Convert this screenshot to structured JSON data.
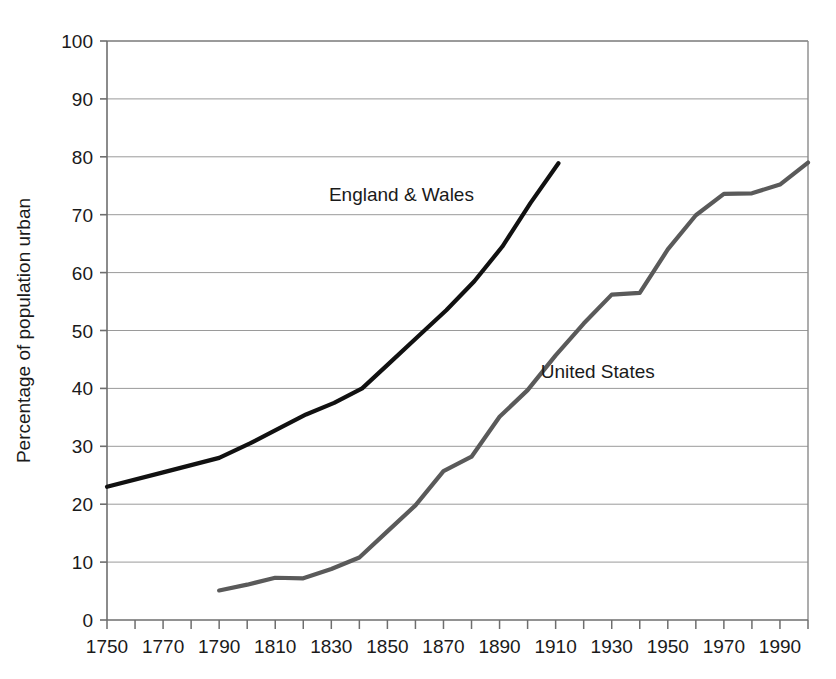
{
  "chart_data": {
    "type": "line",
    "title": "",
    "xlabel": "",
    "ylabel": "Percentage of population urban",
    "xlim": [
      1750,
      2000
    ],
    "ylim": [
      0,
      100
    ],
    "grid": true,
    "grid_axis": "y",
    "legend": "inline-annotations",
    "x_major_step": 20,
    "x_minor_step": 10,
    "y_step": 10,
    "xticks": [
      "1750",
      "1770",
      "1790",
      "1810",
      "1830",
      "1850",
      "1870",
      "1890",
      "1910",
      "1930",
      "1950",
      "1970",
      "1990"
    ],
    "xtick_values": [
      1750,
      1770,
      1790,
      1810,
      1830,
      1850,
      1870,
      1890,
      1910,
      1930,
      1950,
      1970,
      1990
    ],
    "yticks": [
      "0",
      "10",
      "20",
      "30",
      "40",
      "50",
      "60",
      "70",
      "80",
      "90",
      "100"
    ],
    "ytick_values": [
      0,
      10,
      20,
      30,
      40,
      50,
      60,
      70,
      80,
      90,
      100
    ],
    "series": [
      {
        "name": "England & Wales",
        "color": "#111111",
        "width": 4.2,
        "label_x": 1855,
        "label_y": 73.5,
        "label_anchor": "middle",
        "x": [
          1750,
          1770,
          1790,
          1801,
          1811,
          1821,
          1831,
          1841,
          1851,
          1861,
          1871,
          1881,
          1891,
          1901,
          1911
        ],
        "y": [
          23.0,
          25.5,
          28.0,
          30.5,
          33.0,
          35.5,
          37.5,
          40.0,
          44.5,
          49.0,
          53.5,
          58.5,
          64.5,
          72.0,
          78.9
        ]
      },
      {
        "name": "United States",
        "color": "#5a5a5a",
        "width": 4.2,
        "label_x": 1925,
        "label_y": 43.0,
        "label_anchor": "middle",
        "x": [
          1790,
          1800,
          1810,
          1820,
          1830,
          1840,
          1850,
          1860,
          1870,
          1880,
          1890,
          1900,
          1910,
          1920,
          1930,
          1940,
          1950,
          1960,
          1970,
          1980,
          1990,
          2000
        ],
        "y": [
          5.1,
          6.1,
          7.3,
          7.2,
          8.8,
          10.8,
          15.3,
          19.8,
          25.7,
          28.2,
          35.1,
          39.7,
          45.7,
          51.2,
          56.2,
          56.5,
          64.0,
          69.9,
          73.6,
          73.7,
          75.2,
          79.0
        ]
      }
    ]
  },
  "plot_geometry": {
    "left": 107,
    "top": 41,
    "right": 808,
    "bottom": 620
  }
}
